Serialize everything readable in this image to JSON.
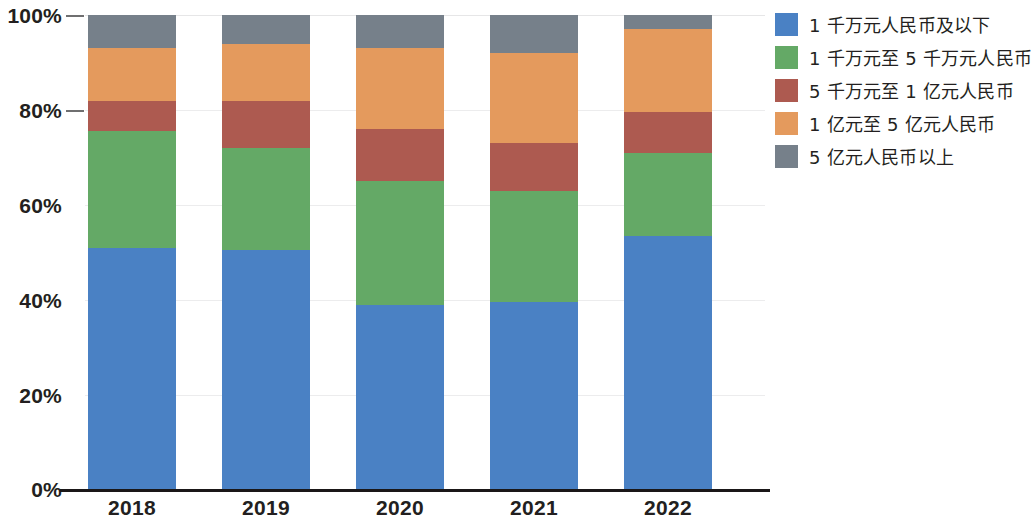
{
  "chart_data": {
    "type": "bar",
    "stacked": true,
    "normalized_percent": true,
    "title": "",
    "subtitle": "",
    "xlabel": "",
    "ylabel": "",
    "categories": [
      "2018",
      "2019",
      "2020",
      "2021",
      "2022"
    ],
    "ylim": [
      0,
      100
    ],
    "yticks": [
      "0%",
      "20%",
      "40%",
      "60%",
      "80%",
      "100%"
    ],
    "ytick_values": [
      0,
      20,
      40,
      60,
      80,
      100
    ],
    "grid": true,
    "legend_position": "right",
    "series": [
      {
        "name": "1 千万元人民币及以下",
        "color": "#4a81c4",
        "values": [
          51.0,
          50.5,
          39.0,
          39.5,
          53.5
        ]
      },
      {
        "name": "1 千万元至 5 千万元人民币",
        "color": "#64a966",
        "values": [
          24.5,
          21.5,
          26.0,
          23.5,
          17.5
        ]
      },
      {
        "name": "5 千万元至 1 亿元人民币",
        "color": "#ad5a50",
        "values": [
          6.5,
          10.0,
          11.0,
          10.0,
          8.5
        ]
      },
      {
        "name": "1 亿元至 5 亿元人民币",
        "color": "#e49a5d",
        "values": [
          11.0,
          12.0,
          17.0,
          19.0,
          17.5
        ]
      },
      {
        "name": "5 亿元人民币以上",
        "color": "#76808a",
        "values": [
          7.0,
          6.0,
          7.0,
          8.0,
          3.0
        ]
      }
    ]
  },
  "legend": {
    "items": [
      {
        "label": "1 千万元人民币及以下"
      },
      {
        "label": "1 千万元至 5 千万元人民币"
      },
      {
        "label": "5 千万元至 1 亿元人民币"
      },
      {
        "label": "1 亿元至 5 亿元人民币"
      },
      {
        "label": "5 亿元人民币以上"
      }
    ]
  },
  "axes": {
    "y_ticks": [
      "100%",
      "80%",
      "60%",
      "40%",
      "20%",
      "0%"
    ],
    "x_ticks": [
      "2018",
      "2019",
      "2020",
      "2021",
      "2022"
    ]
  }
}
